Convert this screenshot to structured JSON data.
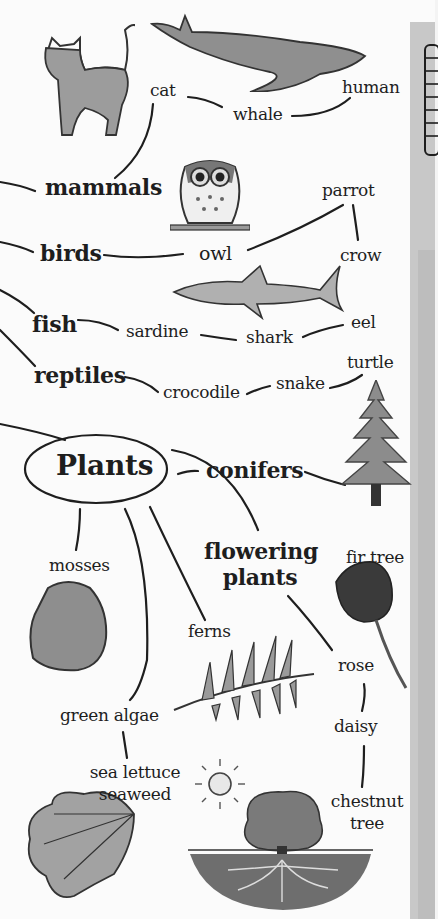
{
  "diagram": {
    "type": "concept-map",
    "categories": {
      "mammals": {
        "label": "mammals",
        "items": [
          "cat",
          "whale",
          "human"
        ]
      },
      "birds": {
        "label": "birds",
        "items": [
          "owl",
          "parrot",
          "crow"
        ]
      },
      "fish": {
        "label": "fish",
        "items": [
          "sardine",
          "shark",
          "eel"
        ]
      },
      "reptiles": {
        "label": "reptiles",
        "items": [
          "crocodile",
          "snake",
          "turtle"
        ]
      },
      "plants": {
        "label": "Plants",
        "conifers": {
          "label": "conifers",
          "items": [
            "fir tree"
          ]
        },
        "flowering": {
          "label": "flowering plants",
          "line1": "flowering",
          "line2": "plants",
          "items": [
            "rose",
            "daisy"
          ],
          "chestnut_line1": "chestnut",
          "chestnut_line2": "tree"
        },
        "mosses": {
          "label": "mosses"
        },
        "ferns": {
          "label": "ferns"
        },
        "algae": {
          "label": "green algae",
          "seaweed_line1": "sea lettuce",
          "seaweed_line2": "seaweed"
        }
      }
    },
    "illustrations": [
      "cat-icon",
      "whale-icon",
      "owl-icon",
      "shark-icon",
      "fir-tree-icon",
      "moss-icon",
      "fern-icon",
      "rose-icon",
      "sun-icon",
      "seaweed-icon",
      "chestnut-tree-icon",
      "ladder-icon"
    ],
    "colors": {
      "ink": "#1e1e1e",
      "paper": "#fbfbfb",
      "wash": "#9a9a9a",
      "strip": "#c8c8c8"
    }
  }
}
